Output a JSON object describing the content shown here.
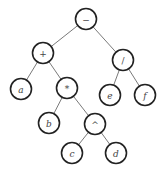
{
  "diagram": {
    "type": "expression-tree",
    "colors": {
      "edge": "#6a6a6a",
      "node_border": "#222222",
      "node_fill": "#ffffff",
      "label": "#444444"
    },
    "node_radius": 10.5,
    "nodes": [
      {
        "id": "minus",
        "label": "−",
        "kind": "operator",
        "x": 86,
        "y": 19
      },
      {
        "id": "plus",
        "label": "+",
        "kind": "operator",
        "x": 43,
        "y": 53
      },
      {
        "id": "divide",
        "label": "/",
        "kind": "operator",
        "x": 123,
        "y": 60
      },
      {
        "id": "a",
        "label": "a",
        "kind": "variable",
        "x": 21,
        "y": 89
      },
      {
        "id": "times",
        "label": "*",
        "kind": "operator",
        "x": 67,
        "y": 88
      },
      {
        "id": "e",
        "label": "e",
        "kind": "variable",
        "x": 110,
        "y": 95
      },
      {
        "id": "f",
        "label": "f",
        "kind": "variable",
        "x": 145,
        "y": 95
      },
      {
        "id": "b",
        "label": "b",
        "kind": "variable",
        "x": 49,
        "y": 123
      },
      {
        "id": "power",
        "label": "^",
        "kind": "operator",
        "x": 95,
        "y": 124
      },
      {
        "id": "c",
        "label": "c",
        "kind": "variable",
        "x": 72,
        "y": 153
      },
      {
        "id": "d",
        "label": "d",
        "kind": "variable",
        "x": 116,
        "y": 153
      }
    ],
    "edges": [
      {
        "from": "minus",
        "to": "plus"
      },
      {
        "from": "minus",
        "to": "divide"
      },
      {
        "from": "plus",
        "to": "a"
      },
      {
        "from": "plus",
        "to": "times"
      },
      {
        "from": "divide",
        "to": "e"
      },
      {
        "from": "divide",
        "to": "f"
      },
      {
        "from": "times",
        "to": "b"
      },
      {
        "from": "times",
        "to": "power"
      },
      {
        "from": "power",
        "to": "c"
      },
      {
        "from": "power",
        "to": "d"
      }
    ]
  }
}
